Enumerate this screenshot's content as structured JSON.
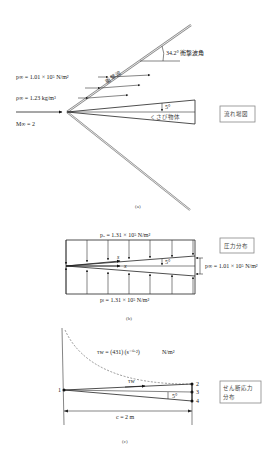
{
  "figure_a": {
    "caption": "(a)",
    "p_inf": "p∞ = 1.01 × 10⁵ N/m²",
    "rho_inf": "ρ∞ = 1.23 kg/m³",
    "mach_inf": "M∞ = 2",
    "shock_label": "衝撃波",
    "shock_angle": "34.2° 衝撃波角",
    "wedge_angle": "5°",
    "wedge_label": "くさび物体",
    "box_label": "流れ場図"
  },
  "figure_b": {
    "caption": "(b)",
    "p_upper": "pᵤ = 1.31 × 10⁵ N/m²",
    "p_lower": "pₗ = 1.31 × 10⁵ N/m²",
    "p_inf": "p∞ = 1.01 × 10⁵ N/m²",
    "s_label": "s",
    "x_label": "x",
    "wedge_angle": "5°",
    "box_label": "圧力分布"
  },
  "figure_c": {
    "caption": "(c)",
    "tau_formula": "τw = (431) (s⁻⁰·²)",
    "tau_unit": "N/m²",
    "tau_label": "τw",
    "chord": "c = 2 m",
    "wedge_angle": "5°",
    "points": [
      "1",
      "2",
      "3",
      "4"
    ],
    "box_label_line1": "せん断応力",
    "box_label_line2": "分布"
  }
}
